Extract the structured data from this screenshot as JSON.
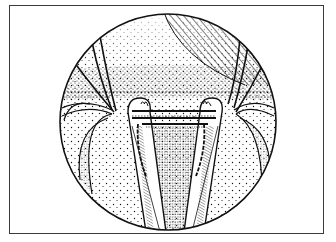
{
  "figure": {
    "type": "medical-illustration",
    "style": "stippled line art",
    "colors": {
      "ink": "#111111",
      "paper": "#ffffff",
      "frame": "#3a3a3a"
    },
    "frame": {
      "x": 9,
      "y": 5,
      "width": 315,
      "height": 229
    },
    "circle": {
      "cx": 168,
      "cy": 122,
      "r": 108
    }
  }
}
